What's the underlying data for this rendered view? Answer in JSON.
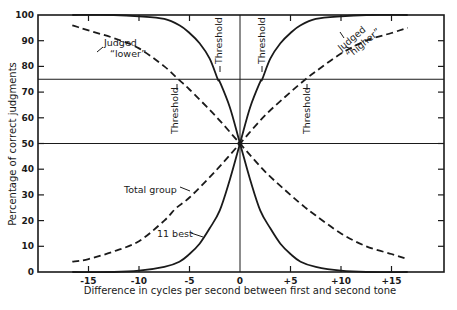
{
  "chart_data": {
    "type": "line",
    "title": "",
    "xlabel": "Difference in cycles per second between first and second tone",
    "ylabel": "Percentage of correct judgments",
    "xlim": [
      -17,
      20
    ],
    "ylim": [
      0,
      100
    ],
    "x_ticks": [
      "-15",
      "-10",
      "-5",
      "0",
      "+5",
      "+10",
      "+15"
    ],
    "x_tick_values": [
      -15,
      -10,
      -5,
      0,
      5,
      10,
      15
    ],
    "y_ticks": [
      "0",
      "10",
      "20",
      "30",
      "40",
      "50",
      "60",
      "70",
      "80",
      "90",
      "100"
    ],
    "y_tick_values": [
      0,
      10,
      20,
      30,
      40,
      50,
      60,
      70,
      80,
      90,
      100
    ],
    "grid": false,
    "reference_lines": [
      {
        "axis": "y",
        "value": 75,
        "label": "Threshold level"
      },
      {
        "axis": "y",
        "value": 50,
        "label": "Chance level"
      },
      {
        "axis": "x",
        "value": 0
      }
    ],
    "series": [
      {
        "name": "Total group - judged \"higher\"",
        "style": "dashed",
        "x": [
          -16.6,
          -15,
          -12.5,
          -10,
          -7.5,
          -6.3,
          -5,
          -2.5,
          0,
          2.5,
          5,
          6.5,
          7.5,
          10,
          12.5,
          15,
          16.6
        ],
        "y": [
          4,
          5,
          8,
          12,
          20,
          25,
          29,
          39,
          50,
          61,
          70,
          75,
          78,
          85,
          90,
          93,
          95
        ]
      },
      {
        "name": "Total group - judged \"lower\"",
        "style": "dashed",
        "x": [
          -16.6,
          -15,
          -12.5,
          -10,
          -7.5,
          -6.1,
          -5,
          -2.5,
          0,
          2.5,
          5,
          6.5,
          7.5,
          10,
          12.5,
          15,
          16.6
        ],
        "y": [
          96,
          94,
          91,
          87,
          80,
          75,
          71,
          61,
          50,
          39,
          30,
          25,
          22,
          15,
          10,
          7,
          5
        ]
      },
      {
        "name": "11 best - judged \"higher\"",
        "style": "solid",
        "x": [
          -16.6,
          -12.5,
          -10,
          -7.5,
          -6,
          -5,
          -4,
          -3,
          -2,
          -1,
          0,
          1,
          2,
          2.2,
          3,
          4,
          5,
          6,
          7.5,
          10,
          12.5,
          16.6
        ],
        "y": [
          0,
          0,
          0.5,
          2,
          4,
          7,
          11,
          17,
          24,
          36,
          50,
          64,
          74,
          75,
          83,
          89,
          93,
          96,
          98.5,
          99.5,
          100,
          100
        ]
      },
      {
        "name": "11 best - judged \"lower\"",
        "style": "solid",
        "x": [
          -16.6,
          -12.5,
          -10,
          -7.5,
          -6,
          -5,
          -4,
          -3,
          -2.2,
          -2,
          -1,
          0,
          1,
          2,
          3,
          4,
          5,
          6,
          7.5,
          10,
          12.5,
          16.6
        ],
        "y": [
          100,
          100,
          99.5,
          98.5,
          96,
          93,
          89,
          83,
          75,
          74,
          64,
          50,
          36,
          24,
          17,
          11,
          7,
          4,
          2,
          0.5,
          0,
          0
        ]
      }
    ],
    "annotations": [
      {
        "text": "Judged",
        "text2": "\"lower\"",
        "target": "Total group - judged \"lower\""
      },
      {
        "text": "Judged",
        "text2": "\"higher\"",
        "target": "Total group - judged \"higher\""
      },
      {
        "text": "Total group",
        "target": "Total group - judged \"higher\""
      },
      {
        "text": "11 best",
        "target": "11 best - judged \"higher\""
      },
      {
        "text": "Threshold",
        "orientation": "vertical",
        "x": -6.2
      },
      {
        "text": "Threshold",
        "orientation": "vertical",
        "x": -2.2
      },
      {
        "text": "Threshold",
        "orientation": "vertical",
        "x": 2.2
      },
      {
        "text": "Threshold",
        "orientation": "vertical",
        "x": 6.5
      }
    ]
  },
  "labels": {
    "xlabel": "Difference in cycles per second between first and second tone",
    "ylabel": "Percentage of correct judgments",
    "judged": "Judged",
    "lower": "“lower”",
    "higher": "“higher”",
    "total_group": "Total group",
    "best": "11 best",
    "threshold": "Threshold"
  },
  "colors": {
    "ink": "#1a1a1a",
    "background": "#ffffff"
  }
}
